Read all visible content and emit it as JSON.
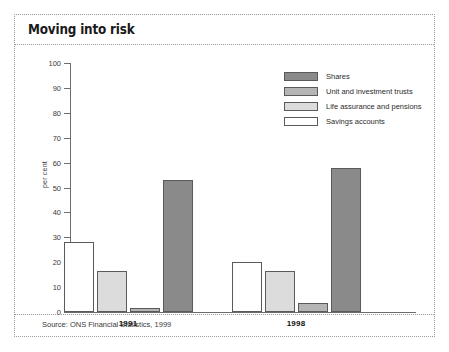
{
  "chart_title": "Moving into risk",
  "source_note": "Source: ONS Financial Statistics, 1999",
  "legend": {
    "items": [
      {
        "label": "Shares",
        "color": "#8a8a8a"
      },
      {
        "label": "Unit and investment trusts",
        "color": "#b5b5b5"
      },
      {
        "label": "Life assurance and pensions",
        "color": "#dcdcdc"
      },
      {
        "label": "Savings accounts",
        "color": "#ffffff"
      }
    ]
  },
  "chart_data": {
    "type": "bar",
    "title": "Moving into risk",
    "subtitle": "",
    "xlabel": "",
    "ylabel": "per cent",
    "ylim": [
      0,
      100
    ],
    "yticks": [
      0,
      10,
      20,
      30,
      40,
      50,
      60,
      70,
      80,
      90,
      100
    ],
    "ytick_labels": [
      "0",
      "10",
      "20",
      "30",
      "40",
      "50",
      "60",
      "70",
      "80",
      "90",
      "100"
    ],
    "grid": false,
    "legend_position": "top-right",
    "categories": [
      "1991",
      "1998"
    ],
    "series": [
      {
        "name": "Savings accounts",
        "color": "#ffffff",
        "values": [
          28,
          20
        ]
      },
      {
        "name": "Life assurance and pensions",
        "color": "#dcdcdc",
        "values": [
          16.5,
          16.5
        ]
      },
      {
        "name": "Unit and investment trusts",
        "color": "#b5b5b5",
        "values": [
          1.5,
          3.5
        ]
      },
      {
        "name": "Shares",
        "color": "#8a8a8a",
        "values": [
          53,
          58
        ]
      }
    ],
    "annotations": [
      "Source: ONS Financial Statistics, 1999"
    ]
  }
}
